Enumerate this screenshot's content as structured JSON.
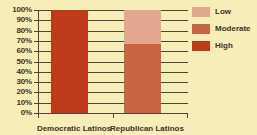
{
  "chart_data": {
    "type": "bar",
    "subtype": "100% stacked bar",
    "title": "",
    "xlabel": "",
    "ylabel": "",
    "ylim": [
      0,
      100
    ],
    "grid": true,
    "legend_position": "right",
    "categories": [
      "Democratic Latinos",
      "Republican Latinos"
    ],
    "tick_labels": [
      "0%",
      "10%",
      "20%",
      "30%",
      "40%",
      "50%",
      "60%",
      "70%",
      "80%",
      "90%",
      "100%"
    ],
    "series": [
      {
        "name": "Low",
        "color": "#e3a68f",
        "values": [
          0,
          33
        ]
      },
      {
        "name": "Moderate",
        "color": "#c96545",
        "values": [
          0,
          67
        ]
      },
      {
        "name": "High",
        "color": "#bd3a1b",
        "values": [
          100,
          0
        ]
      }
    ]
  },
  "legend": {
    "items": [
      {
        "label": "Low",
        "color": "#e3a68f"
      },
      {
        "label": "Moderate",
        "color": "#c96545"
      },
      {
        "label": "High",
        "color": "#bd3a1b"
      }
    ]
  },
  "colors": {
    "background": "#f7edb8",
    "axis": "#4a4535",
    "grid": "#4a4535",
    "text": "#3a3526"
  },
  "title_fragment": ""
}
